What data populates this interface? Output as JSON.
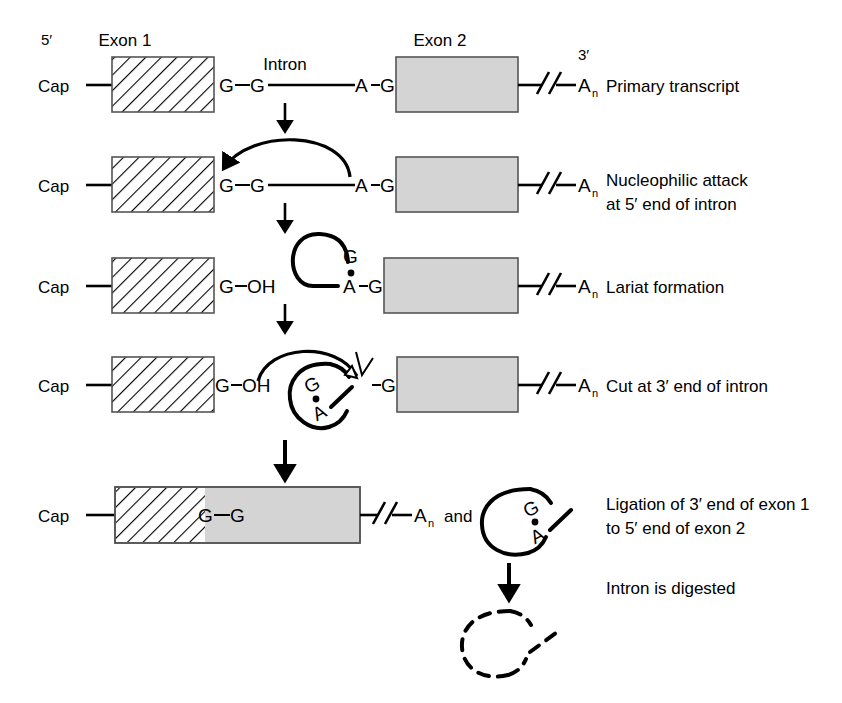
{
  "figure": {
    "colors": {
      "exon2_fill": "#d4d4d4",
      "exon1_fill": "#ffffff",
      "line": "#000000",
      "box_border": "#555555"
    }
  },
  "top_labels": {
    "exon1": "Exon 1",
    "exon2": "Exon 2",
    "intron": "Intron",
    "five_prime": "5′",
    "three_prime": "3′"
  },
  "steps": [
    {
      "id": "primary-transcript",
      "label": "Primary transcript",
      "cap": "Cap",
      "nucleotides": [
        "G",
        "G",
        "A",
        "G"
      ],
      "poly_a": "A",
      "poly_a_sub": "n",
      "break_symbol": "∕∕"
    },
    {
      "id": "nucleophilic-attack",
      "label_line1": "Nucleophilic attack",
      "label_line2": "at 5′ end of intron",
      "cap": "Cap",
      "nucleotides": [
        "G",
        "G",
        "A",
        "G"
      ],
      "poly_a": "A",
      "poly_a_sub": "n"
    },
    {
      "id": "lariat-formation",
      "label": "Lariat formation",
      "cap": "Cap",
      "exon_end": "G",
      "hydroxyl": "OH",
      "lariat_g": "G",
      "branch_a": "A",
      "branch_g": "G",
      "poly_a": "A",
      "poly_a_sub": "n"
    },
    {
      "id": "cut-at-3-prime",
      "label": "Cut at 3′ end of intron",
      "cap": "Cap",
      "exon_end": "G",
      "hydroxyl": "OH",
      "lariat_g": "G",
      "branch_a": "A",
      "exon2_start": "G",
      "poly_a": "A",
      "poly_a_sub": "n"
    },
    {
      "id": "ligation",
      "label_line1": "Ligation of 3′ end of exon 1",
      "label_line2": "to 5′ end of exon 2",
      "cap": "Cap",
      "junction_left": "G",
      "junction_right": "G",
      "poly_a": "A",
      "poly_a_sub": "n",
      "conjunction": "and",
      "lariat_g": "G",
      "branch_a": "A"
    },
    {
      "id": "intron-digested",
      "label": "Intron is digested"
    }
  ]
}
